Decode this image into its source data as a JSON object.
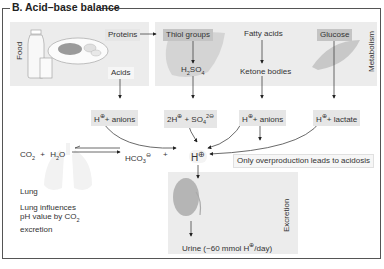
{
  "title": "B. Acid–base balance",
  "panels": {
    "food_label": "Food",
    "metabolism_label": "Metabolism",
    "excretion_label": "Excretion"
  },
  "nodes": {
    "proteins": "Proteins",
    "acids": "Acids",
    "thiol_groups": "Thiol groups",
    "h2so4_h": "H",
    "h2so4_2": "2",
    "h2so4_so": "SO",
    "h2so4_4": "4",
    "fatty_acids": "Fatty acids",
    "ketone_bodies": "Ketone bodies",
    "glucose": "Glucose",
    "h_anions_1": "H",
    "h_anions_1_rest": "+ anions",
    "h_sulfate_pre": "2H",
    "h_sulfate_mid": " + SO",
    "h_sulfate_sub": "4",
    "h_sulfate_sup": "2",
    "h_anions_2": "H",
    "h_anions_2_rest": "+ anions",
    "h_lactate": "H",
    "h_lactate_rest": "+ lactate",
    "overproduction_note": "Only overproduction leads to acidosis",
    "h_center": "H",
    "urine_pre": "Urine (~60 mmol H",
    "urine_post": "/day)"
  },
  "lung": {
    "co2": "CO",
    "co2_sub": "2",
    "plus1": "+",
    "h2o_h": "H",
    "h2o_sub": "2",
    "h2o_o": "O",
    "hco3": "HCO",
    "hco3_sub": "3",
    "plus2": "+",
    "lung_label": "Lung",
    "influence_line1": "Lung influences",
    "influence_line2_pre": "pH value by CO",
    "influence_line2_sub": "2",
    "influence_line3": "excretion"
  },
  "symbols": {
    "plus_charge": "⊕",
    "minus_charge": "⊖"
  }
}
